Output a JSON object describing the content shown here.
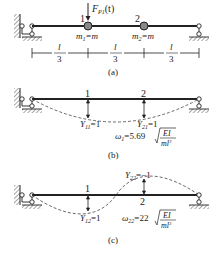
{
  "panel_a": {
    "caption": "(a)",
    "force_label": "F",
    "force_sub": "P1",
    "force_arg": "(t)",
    "node1": "1",
    "node2": "2",
    "mass1": "m",
    "mass1_sub": "1",
    "mass1_eq": "=m",
    "mass2": "m",
    "mass2_sub": "2",
    "mass2_eq": "=m",
    "span_num": "l",
    "span_den": "3"
  },
  "panel_b": {
    "caption": "(b)",
    "node1": "1",
    "node2": "2",
    "y11_label": "Y",
    "y11_sub": "11",
    "y11_val": "=1",
    "y21_label": "Y",
    "y21_sub": "21",
    "y21_val": "=1",
    "omega": "ω",
    "omega_sub": "1",
    "omega_coef": "=5.69",
    "num": "EI",
    "den": "ml",
    "den_exp": "3"
  },
  "panel_c": {
    "caption": "(c)",
    "node1": "1",
    "node2": "2",
    "y12_label": "Y",
    "y12_sub": "12",
    "y12_val": "=1",
    "y22_label": "Y",
    "y22_sub": "22",
    "y22_val": "=−1",
    "omega": "ω",
    "omega_sub": "22",
    "omega_coef": "=22",
    "num": "EI",
    "den": "ml",
    "den_exp": "3"
  }
}
